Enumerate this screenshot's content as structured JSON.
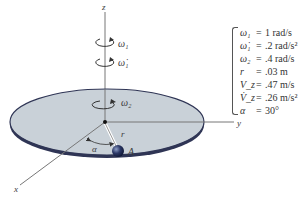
{
  "diagram": {
    "axes": {
      "z": "z",
      "y": "y",
      "x": "x"
    },
    "labels": {
      "omega1": "ω₁",
      "omega1_dot": "ω̇₁",
      "omega2": "ω₂",
      "r": "r",
      "alpha": "α",
      "point": "A"
    },
    "colors": {
      "disc_fill": "#c9d1d8",
      "disc_edge": "#2f3555",
      "axis": "#555555",
      "ball": "#1f2a55"
    }
  },
  "given": [
    {
      "symbol": "ω₁",
      "value": "1 rad/s"
    },
    {
      "symbol": "ω̇₁",
      "value": ".2 rad/s²"
    },
    {
      "symbol": "ω₂",
      "value": ".4 rad/s"
    },
    {
      "symbol": "r",
      "value": ".03 m"
    },
    {
      "symbol": "V_z",
      "value": ".47 m/s"
    },
    {
      "symbol": "V̇_z",
      "value": ".26 m/s²"
    },
    {
      "symbol": "α",
      "value": "30°"
    }
  ]
}
